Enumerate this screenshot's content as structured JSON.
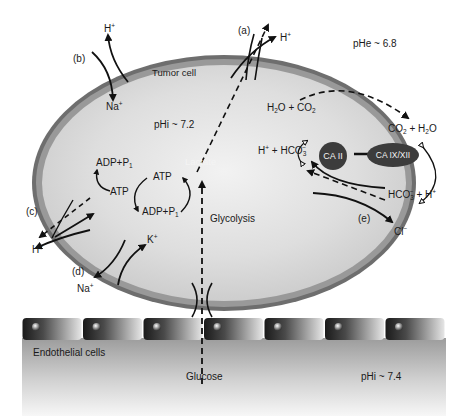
{
  "diagram": {
    "regions": {
      "tumor_cell_label": "Tumor cell",
      "intracellular_ph": "pHi ~ 7.2",
      "extracellular_ph": "pHe ~ 6.8",
      "endothelial_label": "Endothelial cells",
      "blood_ph": "pHi ~ 7.4"
    },
    "transporters": {
      "a": "(a)",
      "b": "(b)",
      "c": "(c)",
      "d": "(d)",
      "e": "(e)"
    },
    "species": {
      "h_plus_a": "H",
      "h_plus_b": "H",
      "na_plus_b": "Na",
      "h_plus_c": "H",
      "k_plus_d": "K",
      "na_plus_d": "Na",
      "cl_minus_e": "Cl",
      "plus": "+",
      "minus": "−"
    },
    "metabolism": {
      "lactate": "Lactate",
      "glycolysis": "Glycolysis",
      "glucose": "Glucose",
      "atp_top": "ATP",
      "atp_left": "ATP",
      "adp_pi_top": "ADP+P",
      "adp_pi_bottom": "ADP+P",
      "pi_sub": "1"
    },
    "carbonic": {
      "h2o_co2_in": [
        "H",
        "2",
        "O + CO",
        "2"
      ],
      "h_hco3_in": [
        "H",
        "+",
        " + HCO",
        "3",
        "−"
      ],
      "co2_h2o_out": [
        "CO",
        "2",
        " + H",
        "2",
        "O"
      ],
      "hco3_h_out": [
        "HCO",
        "3",
        "−",
        " + H",
        "+"
      ],
      "ca2": "CA II",
      "ca9": "CA IX/XII"
    },
    "colors": {
      "membrane": "#7a7a7a",
      "cytoplasm": "#d8d8d8",
      "enzyme": "#3c3c3c",
      "arrow": "#111111"
    }
  }
}
